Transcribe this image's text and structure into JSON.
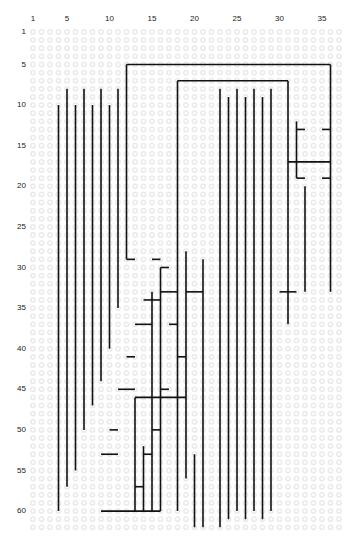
{
  "figure": {
    "title": "",
    "caption": "",
    "dot_color": "#eaeaea",
    "line_color": "#111111",
    "background": "#ffffff",
    "x_axis": {
      "label": "",
      "ticks": [
        1,
        5,
        10,
        15,
        20,
        25,
        30,
        35
      ],
      "min": 1,
      "max": 37
    },
    "y_axis": {
      "label": "",
      "ticks": [
        1,
        5,
        10,
        15,
        20,
        25,
        30,
        35,
        40,
        45,
        50,
        55,
        60
      ],
      "min": 1,
      "max": 62
    }
  },
  "chart_data": {
    "type": "table",
    "title": "",
    "xlabel": "",
    "ylabel": "",
    "xlim": [
      1,
      37
    ],
    "ylim": [
      1,
      62
    ],
    "grid": true,
    "legend": "none",
    "grid_marker": "open-circle",
    "vertical_segments": [
      {
        "col": 4,
        "row_start": 10,
        "row_end": 60
      },
      {
        "col": 5,
        "row_start": 8,
        "row_end": 57
      },
      {
        "col": 6,
        "row_start": 10,
        "row_end": 55
      },
      {
        "col": 7,
        "row_start": 8,
        "row_end": 50
      },
      {
        "col": 8,
        "row_start": 10,
        "row_end": 47
      },
      {
        "col": 9,
        "row_start": 8,
        "row_end": 44
      },
      {
        "col": 10,
        "row_start": 10,
        "row_end": 40
      },
      {
        "col": 11,
        "row_start": 8,
        "row_end": 35
      },
      {
        "col": 12,
        "row_start": 5,
        "row_end": 29
      },
      {
        "col": 13,
        "row_start": 46,
        "row_end": 60
      },
      {
        "col": 14,
        "row_start": 52,
        "row_end": 60
      },
      {
        "col": 15,
        "row_start": 33,
        "row_end": 60
      },
      {
        "col": 16,
        "row_start": 30,
        "row_end": 60
      },
      {
        "col": 18,
        "row_start": 7,
        "row_end": 60
      },
      {
        "col": 19,
        "row_start": 28,
        "row_end": 56
      },
      {
        "col": 20,
        "row_start": 53,
        "row_end": 62
      },
      {
        "col": 21,
        "row_start": 29,
        "row_end": 62
      },
      {
        "col": 23,
        "row_start": 8,
        "row_end": 62
      },
      {
        "col": 24,
        "row_start": 9,
        "row_end": 61
      },
      {
        "col": 25,
        "row_start": 8,
        "row_end": 60
      },
      {
        "col": 26,
        "row_start": 9,
        "row_end": 61
      },
      {
        "col": 27,
        "row_start": 8,
        "row_end": 60
      },
      {
        "col": 28,
        "row_start": 9,
        "row_end": 61
      },
      {
        "col": 29,
        "row_start": 8,
        "row_end": 60
      },
      {
        "col": 31,
        "row_start": 7,
        "row_end": 37
      },
      {
        "col": 32,
        "row_start": 12,
        "row_end": 19
      },
      {
        "col": 33,
        "row_start": 20,
        "row_end": 33
      },
      {
        "col": 36,
        "row_start": 5,
        "row_end": 33
      }
    ],
    "horizontal_segments": [
      {
        "row": 5,
        "col_start": 12,
        "col_end": 36
      },
      {
        "row": 7,
        "col_start": 18,
        "col_end": 31
      },
      {
        "row": 13,
        "col_start": 32,
        "col_end": 33
      },
      {
        "row": 13,
        "col_start": 35,
        "col_end": 36
      },
      {
        "row": 17,
        "col_start": 31,
        "col_end": 36
      },
      {
        "row": 19,
        "col_start": 32,
        "col_end": 33
      },
      {
        "row": 19,
        "col_start": 35,
        "col_end": 36
      },
      {
        "row": 29,
        "col_start": 12,
        "col_end": 13
      },
      {
        "row": 29,
        "col_start": 15,
        "col_end": 16
      },
      {
        "row": 30,
        "col_start": 16,
        "col_end": 17
      },
      {
        "row": 33,
        "col_start": 16,
        "col_end": 18
      },
      {
        "row": 33,
        "col_start": 19,
        "col_end": 21
      },
      {
        "row": 33,
        "col_start": 30,
        "col_end": 32
      },
      {
        "row": 34,
        "col_start": 14,
        "col_end": 16
      },
      {
        "row": 37,
        "col_start": 13,
        "col_end": 15
      },
      {
        "row": 37,
        "col_start": 17,
        "col_end": 18
      },
      {
        "row": 41,
        "col_start": 18,
        "col_end": 19
      },
      {
        "row": 41,
        "col_start": 12,
        "col_end": 13
      },
      {
        "row": 45,
        "col_start": 11,
        "col_end": 13
      },
      {
        "row": 45,
        "col_start": 16,
        "col_end": 17
      },
      {
        "row": 46,
        "col_start": 13,
        "col_end": 19
      },
      {
        "row": 50,
        "col_start": 10,
        "col_end": 11
      },
      {
        "row": 50,
        "col_start": 15,
        "col_end": 16
      },
      {
        "row": 53,
        "col_start": 9,
        "col_end": 11
      },
      {
        "row": 53,
        "col_start": 14,
        "col_end": 15
      },
      {
        "row": 57,
        "col_start": 13,
        "col_end": 14
      },
      {
        "row": 60,
        "col_start": 9,
        "col_end": 16
      }
    ]
  }
}
